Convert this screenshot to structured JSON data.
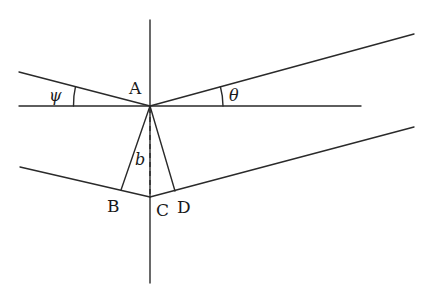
{
  "diagram": {
    "labels": {
      "A": "A",
      "B": "B",
      "C": "C",
      "D": "D",
      "b": "b",
      "psi": "ψ",
      "theta": "θ"
    },
    "points": {
      "A": [
        150,
        106
      ],
      "B": [
        121,
        190
      ],
      "C": [
        150,
        197
      ],
      "D": [
        175,
        191
      ]
    },
    "lines": {
      "vertical": [
        [
          150,
          20
        ],
        [
          150,
          283
        ]
      ],
      "horizontal": [
        [
          19,
          106
        ],
        [
          361,
          106
        ]
      ],
      "upper_left": [
        [
          19,
          72
        ],
        [
          150,
          106
        ]
      ],
      "upper_right": [
        [
          150,
          106
        ],
        [
          414,
          34
        ]
      ],
      "lower_left": [
        [
          20,
          167
        ],
        [
          150,
          197
        ]
      ],
      "lower_right": [
        [
          150,
          197
        ],
        [
          414,
          127
        ]
      ],
      "AB": [
        [
          150,
          106
        ],
        [
          121,
          190
        ]
      ],
      "AD": [
        [
          150,
          106
        ],
        [
          175,
          191
        ]
      ],
      "AC_dashed": [
        [
          150,
          106
        ],
        [
          150,
          197
        ]
      ]
    },
    "colors": {
      "stroke": "#2a2a2a",
      "background": "#ffffff"
    }
  }
}
